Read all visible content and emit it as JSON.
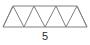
{
  "figure": {
    "kind": "geometry-diagram",
    "label": "5",
    "label_position": "below",
    "colors": {
      "background": "#ffffff",
      "stroke": "#808080",
      "label_text": "#2b2b2b"
    },
    "stroke_width": 1,
    "outline": {
      "shape": "trapezoid",
      "points": "13,6 77,6 87,27 3,27",
      "top_left_x": 13,
      "top_right_x": 77,
      "bottom_left_x": 3,
      "bottom_right_x": 87,
      "top_y": 6,
      "bottom_y": 27
    },
    "zigzag": {
      "description": "internal slanted segments forming the truss web",
      "points": "3,27 13,6 24,27 34,6 45,27 56,6 66,27 77,6 87,27",
      "segment_count": 8,
      "triangles_up": 4,
      "triangles_down": 3,
      "triangles_total": 7
    }
  }
}
